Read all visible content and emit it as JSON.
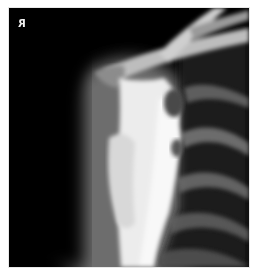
{
  "image": {
    "type": "radiograph",
    "subject": "shoulder / scapula lateral view",
    "marker": {
      "label": "R",
      "mirrored": true,
      "color": "#f2f2f2"
    },
    "colors": {
      "background": "#000000",
      "bone_bright": "#f4f4f4",
      "soft_tissue": "#6a6a6a",
      "page_margin": "#ffffff"
    }
  }
}
